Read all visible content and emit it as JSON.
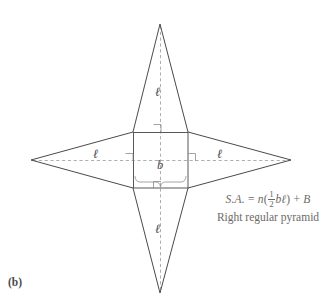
{
  "figure": {
    "panel_label": "(b)",
    "diagram_name": "net-of-right-regular-pyramid",
    "stroke_color": "#4a4a4a",
    "dash_color": "#9a9a9a",
    "text_color": "#6d6a66"
  },
  "labels": {
    "slant_top": "ℓ",
    "slant_left": "ℓ",
    "slant_right": "ℓ",
    "slant_bottom": "ℓ",
    "base_edge": "b"
  },
  "formula": {
    "lhs": "S.A.",
    "equals": "=",
    "coefficient": "n",
    "open_paren": "(",
    "frac_num": "1",
    "frac_den": "2",
    "product": "bℓ",
    "close_paren": ")",
    "plus": "+",
    "base_area": "B",
    "caption": "Right regular pyramid"
  },
  "geometry": {
    "top_apex": "160,24",
    "bottom_apex": "160,293",
    "left_apex": "31,160",
    "right_apex": "291,160",
    "square_left": 133,
    "square_top": 132,
    "square_right": 188,
    "square_bottom": 188
  }
}
